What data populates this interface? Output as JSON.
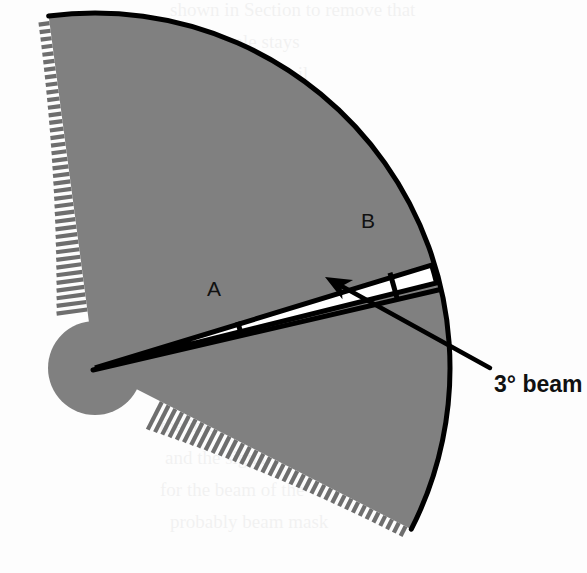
{
  "figure": {
    "background_color": "#fdfdfd",
    "body_fill_color": "#808080",
    "outline_color": "#000000",
    "beam_fill_color": "#ffffff",
    "hatch_color": "#6e6e6e"
  },
  "labels": {
    "point_a": "A",
    "point_b": "B",
    "callout": "3° beam"
  },
  "geometry": {
    "apex_x": 95,
    "apex_y": 368,
    "outer_radius": 355,
    "sector_start_angle_deg": -97.5,
    "sector_end_angle_deg": 27.0,
    "hub_circle_radius": 47,
    "beam_angle_deg": 3,
    "beam_center_angle_deg": -15.5,
    "tick_a_radius": 150,
    "tick_b_radius": 310,
    "arrow_tip_x": 325,
    "arrow_tip_y": 277,
    "callout_line_start_x": 490,
    "callout_line_start_y": 368
  },
  "annotations": {
    "hatch_edge_left": "section-hatching-left-radius",
    "hatch_edge_lower": "section-hatching-lower-radius",
    "arrow": "beam-pointer-arrow"
  },
  "bleed_through_text": [
    "shown in Section to remove that",
    "the sample stays",
    "in direction the coil",
    "centre of the circle",
    "the scan of surface",
    "distribution the field",
    "possible modelled",
    "A sample beam",
    "and the intensity",
    "are large thick",
    "complete in may",
    "and may make it",
    "the intensity of the",
    "and the signal may",
    "for the beam of the",
    "probably beam mask"
  ]
}
